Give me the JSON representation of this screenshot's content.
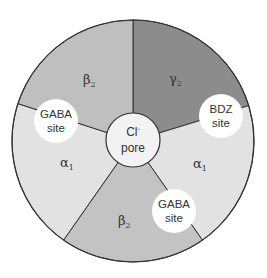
{
  "diagram": {
    "type": "receptor-subunit-wheel",
    "center": {
      "x": 133,
      "y": 141
    },
    "radius": 121,
    "colors": {
      "alpha1": "#e2e2e2",
      "beta2_top": "#bfbfbf",
      "beta2_bottom": "#c3c3c3",
      "gamma2": "#8c8c8c",
      "pore": "#f2f2f2",
      "site": "#ffffff",
      "stroke": "#333333"
    },
    "segments": [
      {
        "id": "gamma2",
        "greek": "γ",
        "sub": "2"
      },
      {
        "id": "alpha1-right",
        "greek": "α",
        "sub": "1"
      },
      {
        "id": "beta2-bottom",
        "greek": "β",
        "sub": "2"
      },
      {
        "id": "alpha1-left",
        "greek": "α",
        "sub": "1"
      },
      {
        "id": "beta2-top",
        "greek": "β",
        "sub": "2"
      }
    ],
    "sites": [
      {
        "id": "gaba-site-left",
        "line1": "GABA",
        "line2": "site"
      },
      {
        "id": "bdz-site",
        "line1": "BDZ",
        "line2": "site"
      },
      {
        "id": "gaba-site-bottom",
        "line1": "GABA",
        "line2": "site"
      }
    ],
    "pore": {
      "line1": "Cl",
      "sup": "-",
      "line2": "pore"
    }
  }
}
